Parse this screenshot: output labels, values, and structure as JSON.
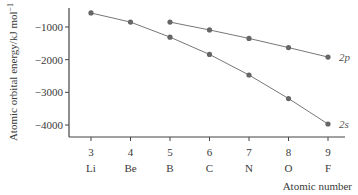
{
  "chart_data": {
    "type": "line",
    "title": "",
    "xlabel": "Atomic number",
    "ylabel": "Atomic orbital energy/kJ mol⁻¹",
    "x": [
      3,
      4,
      5,
      6,
      7,
      8,
      9
    ],
    "x_tick_labels": [
      "3",
      "4",
      "5",
      "6",
      "7",
      "8",
      "9"
    ],
    "x_element_labels": [
      "Li",
      "Be",
      "B",
      "C",
      "N",
      "O",
      "F"
    ],
    "y_ticks": [
      -1000,
      -2000,
      -3000,
      -4000
    ],
    "y_tick_labels": [
      "−1000",
      "−2000",
      "−3000",
      "−4000"
    ],
    "ylim": [
      -4400,
      -400
    ],
    "grid": false,
    "legend": "inline labels at line ends",
    "series": [
      {
        "name": "2s",
        "x": [
          3,
          4,
          5,
          6,
          7,
          8,
          9
        ],
        "values": [
          -570,
          -850,
          -1310,
          -1840,
          -2470,
          -3190,
          -3970
        ]
      },
      {
        "name": "2p",
        "x": [
          5,
          6,
          7,
          8,
          9
        ],
        "values": [
          -850,
          -1090,
          -1350,
          -1630,
          -1920
        ]
      }
    ]
  },
  "labels": {
    "ylabel_main": "Atomic orbital energy/kJ mol",
    "ylabel_sup": "−1",
    "xlabel": "Atomic number",
    "series_2s": "2s",
    "series_2p": "2p"
  }
}
